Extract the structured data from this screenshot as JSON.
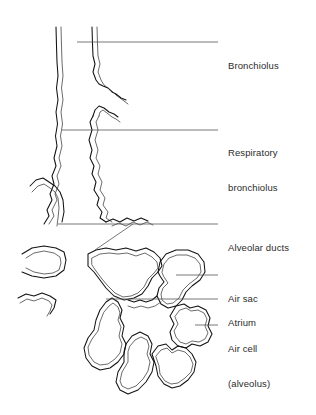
{
  "figure": {
    "background_color": "#ffffff",
    "line_color": "#111111",
    "leader_color": "#555555",
    "text_color": "#2b2b2b"
  },
  "labels": [
    {
      "id": "bronchiolus",
      "text": "Bronchiolus",
      "line1": "Bronchiolus",
      "line2": "",
      "x": 228,
      "y": 37
    },
    {
      "id": "respiratory-bronchiolus",
      "text": "Respiratory bronchiolus",
      "line1": "Respiratory",
      "line2": "bronchiolus",
      "x": 228,
      "y": 124
    },
    {
      "id": "alveolar-ducts",
      "text": "Alveolar ducts",
      "line1": "Alveolar ducts",
      "line2": "",
      "x": 228,
      "y": 219
    },
    {
      "id": "air-sac",
      "text": "Air sac",
      "line1": "Air sac",
      "line2": "",
      "x": 228,
      "y": 270
    },
    {
      "id": "atrium",
      "text": "Atrium",
      "line1": "Atrium",
      "line2": "",
      "x": 228,
      "y": 294
    },
    {
      "id": "air-cell-alveolus",
      "text": "Air cell (alveolus)",
      "line1": "Air cell",
      "line2": "(alveolus)",
      "x": 228,
      "y": 320
    }
  ],
  "leaders": [
    {
      "id": "leader-bronchiolus",
      "points": "77,42 218,42"
    },
    {
      "id": "leader-respiratory-bronchiolus",
      "points": "62,130 218,130"
    },
    {
      "id": "leader-alveolar-ducts",
      "points": "58,224 218,224"
    },
    {
      "id": "leader-alveolar-ducts-branch",
      "points": "95,250 133,224"
    },
    {
      "id": "leader-air-sac",
      "points": "176,275 218,275"
    },
    {
      "id": "leader-atrium",
      "points": "106,299 218,299"
    },
    {
      "id": "leader-air-cell",
      "points": "195,325 218,325"
    }
  ]
}
